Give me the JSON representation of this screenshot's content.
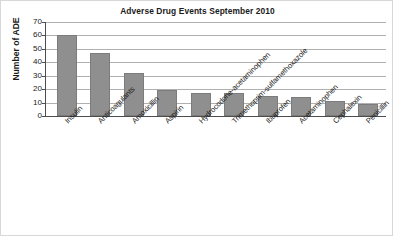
{
  "chart_data": {
    "type": "bar",
    "title": "Adverse Drug Events September 2010",
    "xlabel": "",
    "ylabel": "Number of ADE",
    "categories": [
      "Insulin",
      "Anticoagulants",
      "Amoxicillin",
      "Aspirin",
      "Hydrocodone-acetaminophen",
      "Trimethoprim-sulfamethoxazole",
      "Ibuprofen",
      "Acetaminophen",
      "Cephalexin",
      "Penicillin"
    ],
    "values": [
      60,
      47,
      32,
      19,
      17,
      17,
      15,
      14,
      11,
      9
    ],
    "ylim": [
      0,
      70
    ],
    "yticks": [
      0,
      10,
      20,
      30,
      40,
      50,
      60,
      70
    ],
    "ytick_labels": [
      "0",
      "10",
      "20",
      "30",
      "40",
      "50",
      "60",
      "70"
    ],
    "grid": true,
    "legend": false,
    "bar_color": "#8f8f8f",
    "gridline_color": "#b0b0b0",
    "axis_color": "#4d4d4d",
    "background_color": "#ffffff"
  }
}
